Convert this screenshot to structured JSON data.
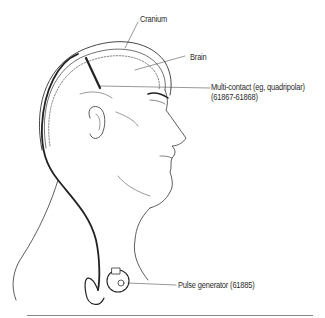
{
  "figure": {
    "type": "anatomical-illustration",
    "labels": {
      "cranium": "Cranium",
      "brain": "Brain",
      "electrode_line1": "Multi-contact (eg, quadripolar)",
      "electrode_line2": "(61867-61868)",
      "pulse_generator": "Pulse generator (61885)"
    },
    "colors": {
      "line": "#333333",
      "lead": "#222222",
      "label_text": "#2a2a2a",
      "rule": "#8a8a8a"
    }
  }
}
